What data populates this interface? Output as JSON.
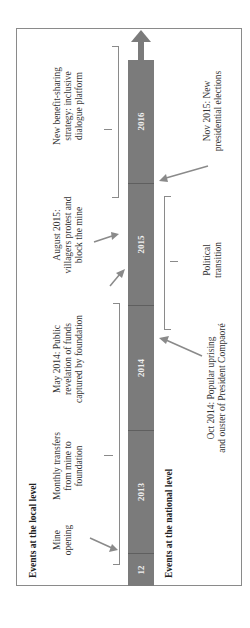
{
  "local_title": "Events at the local level",
  "national_title": "Events at the national level",
  "timeline": {
    "segments": [
      "12",
      "2013",
      "2014",
      "2015",
      "2016"
    ],
    "bar_color": "#7b7b7b"
  },
  "local_events": [
    {
      "text_lines": [
        "Mine",
        "opening"
      ]
    },
    {
      "text_lines": [
        "Monthly transfers",
        "from mine to",
        "foundation"
      ]
    },
    {
      "text_lines": [
        "May 2014: Public",
        "revelation of funds",
        "captured by foundation"
      ]
    },
    {
      "text_lines": [
        "August 2015:",
        "villagers protest and",
        "block the mine"
      ]
    },
    {
      "text_lines": [
        "New benefit-sharing",
        "strategy: inclusive",
        "dialogue platform"
      ]
    }
  ],
  "national_events": [
    {
      "text_lines": [
        "Oct 2014: Popular uprising",
        "and ouster of President Compaoré"
      ]
    },
    {
      "text_lines": [
        "Political",
        "transition"
      ]
    },
    {
      "text_lines": [
        "Nov 2015: New",
        "presidential elections"
      ]
    }
  ]
}
